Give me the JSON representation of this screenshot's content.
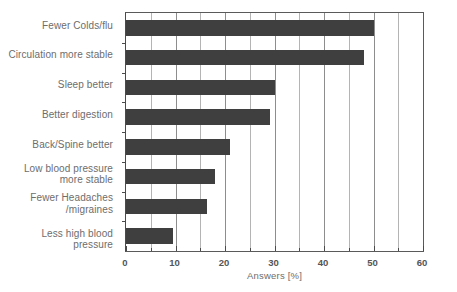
{
  "chart_data": {
    "type": "bar",
    "orientation": "horizontal",
    "title": "",
    "subtitle": "",
    "xlabel": "Answers [%]",
    "ylabel": "",
    "xlim": [
      0,
      60
    ],
    "ylim": null,
    "grid": true,
    "grid_axis": "x",
    "grid_major_step": 10,
    "grid_minor_step": 5,
    "legend": null,
    "legend_position": "none",
    "bar_color": "#3f3f3f",
    "background_color": "#ffffff",
    "axis_color": "#4a4a4a",
    "gridline_color": "#b4b4b4",
    "categories": [
      "Fewer Colds/flu",
      "Circulation more stable",
      "Sleep better",
      "Better digestion",
      "Back/Spine better",
      "Low blood pressure\nmore stable",
      "Fewer Headaches\n/migraines",
      "Less high blood pressure"
    ],
    "values": [
      50,
      48,
      30,
      29,
      21,
      18,
      16.3,
      9.5
    ],
    "xticks": [
      0,
      10,
      20,
      30,
      40,
      50,
      60
    ],
    "xticklabels": [
      "0",
      "10",
      "20",
      "30",
      "40",
      "50",
      "60"
    ],
    "xminorticks": [
      5,
      15,
      25,
      35,
      45,
      55
    ]
  }
}
